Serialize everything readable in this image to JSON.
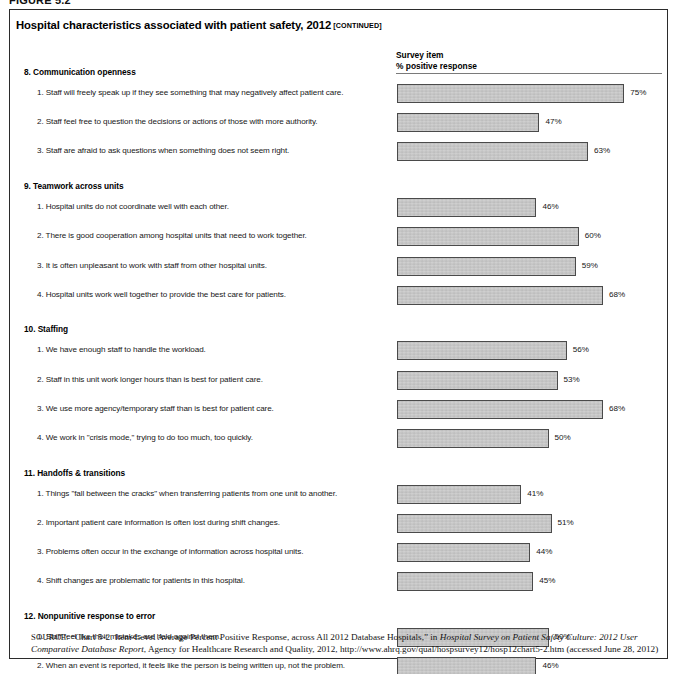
{
  "figure": {
    "label": "FIGURE 5.2",
    "title": "Hospital characteristics associated with patient safety, 2012",
    "continued_tag": "[CONTINUED]"
  },
  "survey_header": {
    "line1": "Survey item",
    "line2": "% positive response"
  },
  "chart_data": {
    "type": "bar",
    "xlabel": "% positive response",
    "ylabel": "Survey item",
    "xlim": [
      0,
      100
    ],
    "grid": false,
    "legend": "none",
    "orientation": "horizontal",
    "value_suffix": "%",
    "categories": [
      "8.1 Staff will freely speak up if they see something that may negatively affect patient care.",
      "8.2 Staff feel free to question the decisions or actions of those with more authority.",
      "8.3 Staff are afraid to ask questions when something does not seem right.",
      "9.1 Hospital units do not coordinate well with each other.",
      "9.2 There is good cooperation among hospital units that need to work together.",
      "9.3 It is often unpleasant to work with staff from other hospital units.",
      "9.4 Hospital units work well together to provide the best care for patients.",
      "10.1 We have enough staff to handle the workload.",
      "10.2 Staff in this unit work longer hours than is best for patient care.",
      "10.3 We use more agency/temporary staff than is best for patient care.",
      "10.4 We work in \"crisis mode,\" trying to do too much, too quickly.",
      "11.1 Things \"fall between the cracks\" when transferring patients from one unit to another.",
      "11.2 Important patient care information is often lost during shift changes.",
      "11.3 Problems often occur in the exchange of information across hospital units.",
      "11.4 Shift changes are problematic for patients in this hospital.",
      "12.1 Staff feel like their mistakes are held against them.",
      "12.2 When an event is reported, it feels like the person is being written up, not the problem.",
      "12.3 Staff worry that mistakes they make are kept in their personnel file."
    ],
    "values": [
      75,
      47,
      63,
      46,
      60,
      59,
      68,
      56,
      53,
      68,
      50,
      41,
      51,
      44,
      45,
      50,
      46,
      35
    ]
  },
  "sections": [
    {
      "title": "8. Communication openness",
      "items": [
        {
          "label": "1. Staff will freely speak up if they see something that may negatively affect patient care.",
          "value": 75,
          "value_label": "75%"
        },
        {
          "label": "2. Staff feel free to question the decisions or actions of those with more authority.",
          "value": 47,
          "value_label": "47%"
        },
        {
          "label": "3. Staff are afraid to ask questions when something does not seem right.",
          "value": 63,
          "value_label": "63%"
        }
      ]
    },
    {
      "title": "9. Teamwork across units",
      "items": [
        {
          "label": "1. Hospital units do not coordinate well with each other.",
          "value": 46,
          "value_label": "46%"
        },
        {
          "label": "2. There is good cooperation among hospital units that need to work together.",
          "value": 60,
          "value_label": "60%"
        },
        {
          "label": "3. It is often unpleasant to work with staff from other hospital units.",
          "value": 59,
          "value_label": "59%"
        },
        {
          "label": "4. Hospital units work well together to provide the best care for patients.",
          "value": 68,
          "value_label": "68%"
        }
      ]
    },
    {
      "title": "10. Staffing",
      "items": [
        {
          "label": "1. We have enough staff to handle the workload.",
          "value": 56,
          "value_label": "56%"
        },
        {
          "label": "2. Staff in this unit work longer hours than is best for patient care.",
          "value": 53,
          "value_label": "53%"
        },
        {
          "label": "3. We use more agency/temporary staff than is best for patient care.",
          "value": 68,
          "value_label": "68%"
        },
        {
          "label": "4. We work in \"crisis mode,\" trying to do too much, too quickly.",
          "value": 50,
          "value_label": "50%"
        }
      ]
    },
    {
      "title": "11. Handoffs & transitions",
      "items": [
        {
          "label": "1. Things \"fall between the cracks\" when transferring patients from one unit to another.",
          "value": 41,
          "value_label": "41%"
        },
        {
          "label": "2. Important patient care information is often lost during shift changes.",
          "value": 51,
          "value_label": "51%"
        },
        {
          "label": "3. Problems often occur in the exchange of information across hospital units.",
          "value": 44,
          "value_label": "44%"
        },
        {
          "label": "4. Shift changes are problematic for patients in this hospital.",
          "value": 45,
          "value_label": "45%"
        }
      ]
    },
    {
      "title": "12. Nonpunitive response to error",
      "items": [
        {
          "label": "1. Staff feel like their mistakes are held against them.",
          "value": 50,
          "value_label": "50%"
        },
        {
          "label": "2. When an event is reported, it feels like the person is being written up, not the problem.",
          "value": 46,
          "value_label": "46%"
        },
        {
          "label": "3. Staff worry that mistakes they make are kept in their personnel file.",
          "value": 35,
          "value_label": "35%"
        }
      ]
    }
  ],
  "source": {
    "label": "SOURCE:",
    "part1": "“Chart 5-2. Item-Level Average Percent Positive Response, across All 2012 Database Hospitals,” in ",
    "italic1": "Hospital Survey on Patient Safety Culture: 2012 User Comparative Database Report",
    "part2": ", Agency for Healthcare Research and Quality, 2012, http://www.ahrq.gov/qual/hospsurvey12/hosp12chart5-2.htm (accessed June 28, 2012)"
  },
  "style": {
    "bar_fill": "#c6c6c6",
    "bar_border": "#4a4a4a",
    "frame_border": "#2b2b2b",
    "text_color": "#171717"
  }
}
